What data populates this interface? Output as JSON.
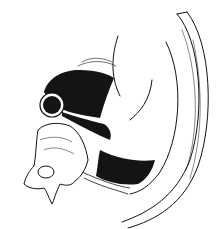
{
  "image": {
    "kind": "anatomical pen-and-ink line drawing",
    "colors": {
      "background": "#ffffff",
      "ink": "#111111",
      "fill_dark": "#141414"
    }
  }
}
